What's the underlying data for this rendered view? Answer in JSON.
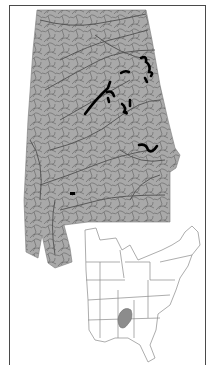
{
  "figure": {
    "type": "range-map",
    "main_map": {
      "region": "Alabama",
      "fill_color": "#a9a9a9",
      "river_color": "#5a5a5a",
      "range_color": "#000000",
      "range_segments": 8,
      "isolated_point": true
    },
    "inset_map": {
      "region": "Eastern United States",
      "outline_color": "#8a8a8a",
      "highlight_region": "Alabama",
      "highlight_color": "#8c8c8c"
    },
    "frame_color": "#4a4a4a"
  }
}
